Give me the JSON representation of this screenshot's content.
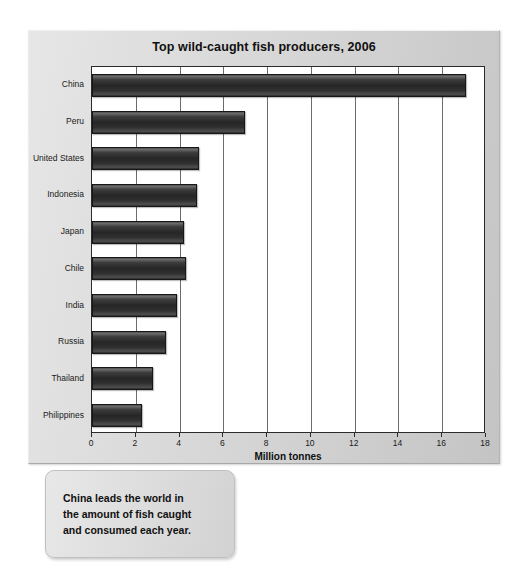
{
  "panel": {
    "background_color": "#d8d8d8"
  },
  "chart_data": {
    "type": "bar",
    "orientation": "horizontal",
    "title": "Top wild-caught fish producers, 2006",
    "xlabel": "Million tonnes",
    "ylabel": "",
    "xlim": [
      0,
      18
    ],
    "xticks": [
      0,
      2,
      4,
      6,
      8,
      10,
      12,
      14,
      16,
      18
    ],
    "grid": true,
    "grid_axis": "x",
    "legend": false,
    "bar_color": "#2b2b2b",
    "categories": [
      "China",
      "Peru",
      "United States",
      "Indonesia",
      "Japan",
      "Chile",
      "India",
      "Russia",
      "Thailand",
      "Philippines"
    ],
    "values": [
      17.1,
      7.0,
      4.9,
      4.8,
      4.2,
      4.3,
      3.9,
      3.4,
      2.8,
      2.3
    ],
    "units": "million tonnes"
  },
  "caption": {
    "text": "China leads the world in\nthe amount of fish caught\nand consumed each year."
  }
}
